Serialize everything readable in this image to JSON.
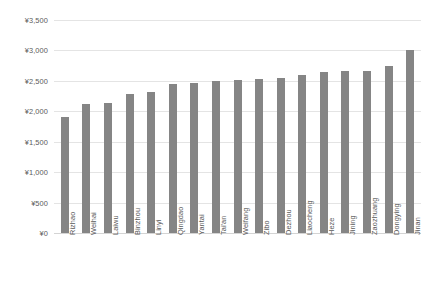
{
  "chart_data": {
    "type": "bar",
    "title": "",
    "subtitle": "",
    "xlabel": "",
    "ylabel": "",
    "ylim": [
      0,
      3500
    ],
    "ytick_step": 500,
    "grid": true,
    "legend": false,
    "legend_position": "none",
    "currency_symbol": "¥",
    "bar_color": "#858585",
    "gridline_color": "#e4e4e4",
    "axis_text_color": "#5a5a5a",
    "background_color": "#ffffff",
    "categories": [
      "Rizhao",
      "Weihai",
      "Laiwu",
      "Binzhou",
      "Linyi",
      "Qingdao",
      "Yantai",
      "Tai'an",
      "Weifang",
      "Zibo",
      "Dezhou",
      "Liaocheng",
      "Heze",
      "Jining",
      "Zaozhuang",
      "Dongying",
      "Jinan"
    ],
    "values": [
      1900,
      2120,
      2130,
      2280,
      2320,
      2450,
      2460,
      2500,
      2510,
      2530,
      2540,
      2600,
      2640,
      2660,
      2660,
      2740,
      3010
    ],
    "ytick_labels": [
      "¥3,500",
      "¥3,000",
      "¥2,500",
      "¥2,000",
      "¥1,500",
      "¥1,000",
      "¥500",
      "¥0"
    ],
    "ytick_values": [
      3500,
      3000,
      2500,
      2000,
      1500,
      1000,
      500,
      0
    ]
  }
}
